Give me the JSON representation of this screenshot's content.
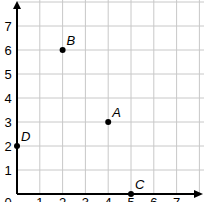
{
  "chart_data": {
    "type": "scatter",
    "title": "",
    "xlabel": "",
    "ylabel": "",
    "xlim": [
      0,
      7.5
    ],
    "ylim": [
      0,
      7.5
    ],
    "grid": true,
    "x_ticks": [
      "0",
      "1",
      "2",
      "3",
      "4",
      "5",
      "6",
      "7"
    ],
    "y_ticks": [
      "1",
      "2",
      "3",
      "4",
      "5",
      "6",
      "7"
    ],
    "points": [
      {
        "label": "A",
        "x": 4,
        "y": 3
      },
      {
        "label": "B",
        "x": 2,
        "y": 6
      },
      {
        "label": "C",
        "x": 5,
        "y": 0
      },
      {
        "label": "D",
        "x": 0,
        "y": 2
      }
    ]
  },
  "colors": {
    "grid": "#c8c8c8",
    "axis": "#000000",
    "point": "#000000"
  }
}
